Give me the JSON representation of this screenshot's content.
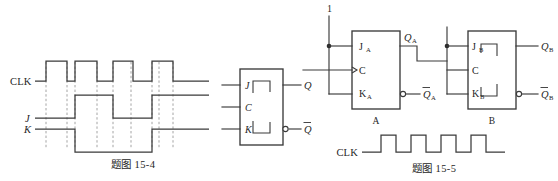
{
  "figure_left": {
    "caption": "题图 15-4",
    "signal_labels": {
      "clk": "CLK",
      "j": "J",
      "k": "K"
    },
    "flipflop": {
      "pins_in": [
        "J",
        "C",
        "K"
      ],
      "pins_out": [
        "Q",
        "Q̅"
      ],
      "q_label": "Q",
      "qbar_label": "Q",
      "qbar_overline": true
    },
    "waveforms": {
      "clk": {
        "name": "CLK",
        "pulses": 4,
        "pattern": "low, 4 rectangular pulses, low"
      },
      "j": {
        "name": "J",
        "pattern": "low, high, low, high"
      },
      "k": {
        "name": "K",
        "pattern": "high, low, high"
      }
    }
  },
  "figure_right": {
    "caption": "题图 15-5",
    "input_label": "1",
    "flipflop_a": {
      "name": "A",
      "pin_j": "J",
      "pin_j_sub": "A",
      "pin_c": "C",
      "pin_k": "K",
      "pin_k_sub": "A",
      "out_q": "Q",
      "out_q_sub": "A",
      "out_qbar": "Q",
      "out_qbar_sub": "A"
    },
    "flipflop_b": {
      "name": "B",
      "pin_j": "J",
      "pin_j_sub": "B",
      "pin_c": "C",
      "pin_k": "K",
      "pin_k_sub": "B",
      "out_q": "Q",
      "out_q_sub": "B",
      "out_qbar": "Q",
      "out_qbar_sub": "B"
    },
    "clk_waveform": {
      "label": "CLK",
      "pulses": 5,
      "pattern": "low, 5 rectangular pulses, low"
    }
  },
  "colors": {
    "ink": "#3a3a3a",
    "dashed": "#8e8e8e",
    "paper": "#ffffff"
  }
}
